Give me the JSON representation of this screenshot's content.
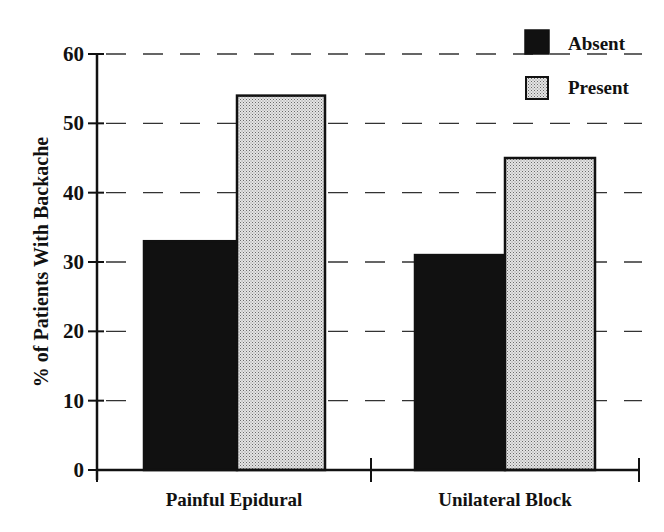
{
  "chart_data": {
    "type": "bar",
    "title": "",
    "xlabel": "",
    "ylabel": "% of Patients With Backache",
    "ylim": [
      0,
      60
    ],
    "yticks": [
      0,
      10,
      20,
      30,
      40,
      50,
      60
    ],
    "grid": "horizontal dashed",
    "legend_position": "top-right",
    "categories": [
      "Painful Epidural",
      "Unilateral Block"
    ],
    "series": [
      {
        "name": "Absent",
        "values": [
          33,
          31
        ],
        "fill": "#111111",
        "pattern": "solid"
      },
      {
        "name": "Present",
        "values": [
          54,
          45
        ],
        "fill": "#cfcfcf",
        "pattern": "stipple"
      }
    ]
  },
  "legend": {
    "items": [
      {
        "label": "Absent"
      },
      {
        "label": "Present"
      }
    ]
  },
  "axis": {
    "y_title": "% of Patients With Backache",
    "y_ticks": [
      "0",
      "10",
      "20",
      "30",
      "40",
      "50",
      "60"
    ],
    "x_categories": [
      "Painful Epidural",
      "Unilateral Block"
    ]
  }
}
